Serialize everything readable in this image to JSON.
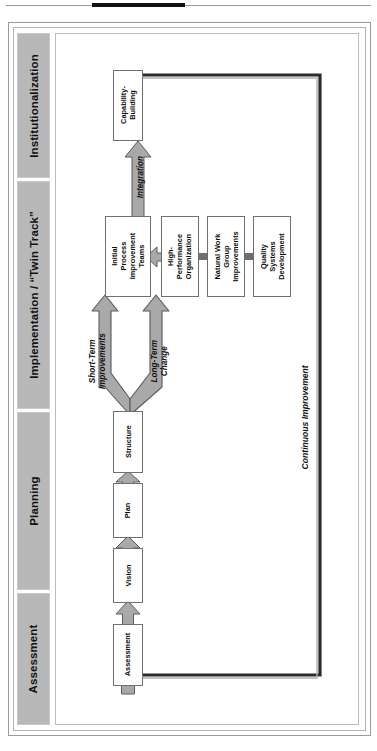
{
  "document": {
    "title": "Organizational Change Process Model",
    "orientation": "rotated-90-ccw"
  },
  "phases": [
    {
      "id": "institutionalization",
      "label": "Institutionalization"
    },
    {
      "id": "implementation",
      "label": "Implementation / “Twin Track”"
    },
    {
      "id": "planning",
      "label": "Planning"
    },
    {
      "id": "assessment",
      "label": "Assessment"
    }
  ],
  "nodes": [
    {
      "id": "capability-building",
      "label": "Capability-\nBuilding",
      "phase": "institutionalization"
    },
    {
      "id": "initial-process-improvement-teams",
      "label": "Initial\nProcess\nImprovement\nTeams",
      "phase": "implementation"
    },
    {
      "id": "high-performance-organization",
      "label": "High-\nPerformance\nOrganization",
      "phase": "implementation"
    },
    {
      "id": "natural-work-group-improvements",
      "label": "Natural Work\nGroup\nImprovements",
      "phase": "implementation"
    },
    {
      "id": "quality-systems-development",
      "label": "Quality\nSystems\nDevelopment",
      "phase": "implementation"
    },
    {
      "id": "structure",
      "label": "Structure",
      "phase": "planning"
    },
    {
      "id": "plan",
      "label": "Plan",
      "phase": "planning"
    },
    {
      "id": "vision",
      "label": "Vision",
      "phase": "planning"
    },
    {
      "id": "assessment",
      "label": "Assessment",
      "phase": "assessment"
    }
  ],
  "flow_labels": [
    {
      "id": "integration",
      "label": "Integration"
    },
    {
      "id": "short-term-improvements",
      "label": "Short-Term\nImprovements"
    },
    {
      "id": "long-term-change",
      "label": "Long-Term\nChange"
    },
    {
      "id": "continuous-improvement",
      "label": "Continuous Improvement"
    }
  ],
  "colors": {
    "phase_bar_fill": "#b8b8b8",
    "arrow_fill": "#a9a9a9",
    "arrow_stroke": "#5a5a5a",
    "node_stroke": "#6f6f6f",
    "loop_stroke": "#2b2b2b",
    "page_background": "#ffffff",
    "rule": "#9a9a9a"
  }
}
